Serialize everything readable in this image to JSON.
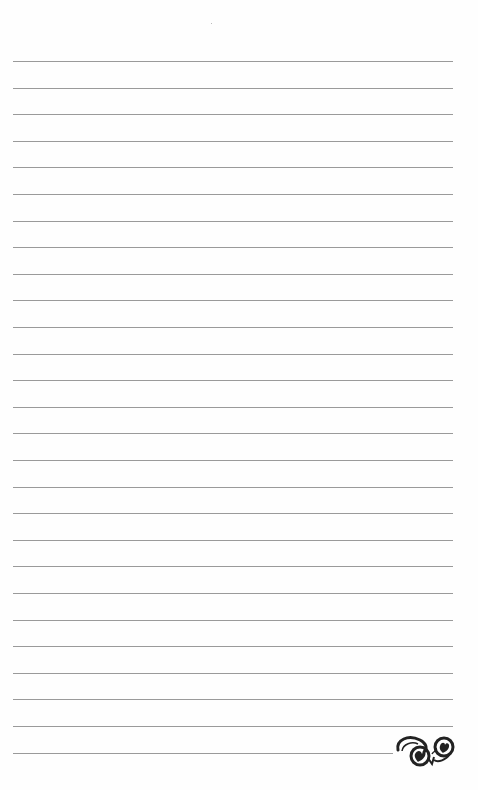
{
  "page": {
    "type": "lined-notebook-page",
    "background": "#fefefe",
    "rule_color": "#9a9a9a",
    "rule_count": 27,
    "first_rule_y": 61,
    "rule_spacing": 26.6,
    "rule_left": 13,
    "rule_width": 440,
    "last_rule_width": 380,
    "ornament": "flourish-icon"
  }
}
